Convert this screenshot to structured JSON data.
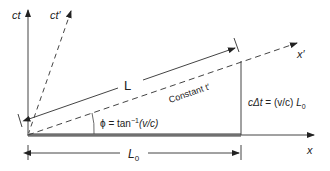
{
  "diagram": {
    "type": "spacetime-diagram",
    "axes": {
      "ct": {
        "label": "ct"
      },
      "ct_prime": {
        "label": "ct′"
      },
      "x": {
        "label": "x"
      },
      "x_prime": {
        "label": "x′"
      }
    },
    "annotations": {
      "L": "L",
      "constant_t": "Constant t′",
      "phi": "ϕ = tan",
      "phi_exp": "−1",
      "phi_arg": "(v/c)",
      "ct_eq_pre": "cΔt",
      "ct_eq_mid": " = (v/c) ",
      "ct_eq_L": "L",
      "ct_eq_sub": "0",
      "L0": "L",
      "L0_sub": "0"
    },
    "colors": {
      "line": "#333333",
      "rod": "#9a9a9a"
    }
  }
}
